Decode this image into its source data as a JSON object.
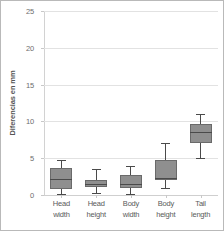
{
  "chart_data": {
    "type": "box",
    "title": "",
    "xlabel": "",
    "ylabel": "Diferencias en mm",
    "ylim": [
      0,
      25
    ],
    "yticks": [
      0,
      5,
      10,
      15,
      20,
      25
    ],
    "grid": true,
    "legend": "none",
    "categories": [
      "Head width",
      "Head height",
      "Body width",
      "Body height",
      "Tail length"
    ],
    "category_lines": [
      [
        "Head",
        "width"
      ],
      [
        "Head",
        "height"
      ],
      [
        "Body",
        "width"
      ],
      [
        "Body",
        "height"
      ],
      [
        "Tail",
        "length"
      ]
    ],
    "boxes": [
      {
        "label": "Head width",
        "whisker_low": 0.2,
        "q1": 0.8,
        "median": 2.2,
        "q3": 3.7,
        "whisker_high": 4.8
      },
      {
        "label": "Head height",
        "whisker_low": 0.3,
        "q1": 1.1,
        "median": 1.5,
        "q3": 2.1,
        "whisker_high": 3.5
      },
      {
        "label": "Body width",
        "whisker_low": 0.2,
        "q1": 1.0,
        "median": 1.5,
        "q3": 2.7,
        "whisker_high": 4.0
      },
      {
        "label": "Body height",
        "whisker_low": 1.0,
        "q1": 2.0,
        "median": 2.3,
        "q3": 4.7,
        "whisker_high": 7.0
      },
      {
        "label": "Tail length",
        "whisker_low": 5.0,
        "q1": 7.0,
        "median": 8.5,
        "q3": 9.7,
        "whisker_high": 11.0
      }
    ],
    "colors": {
      "box_fill": "#8f8f8f",
      "box_edge": "#6a6a6a",
      "whisker": "#4a4a4a",
      "gridline": "#e2e2e2",
      "tick_label": "#6d6d6d",
      "axis_title": "#555555",
      "border": "#b9b9b9",
      "background": "#ffffff"
    }
  }
}
